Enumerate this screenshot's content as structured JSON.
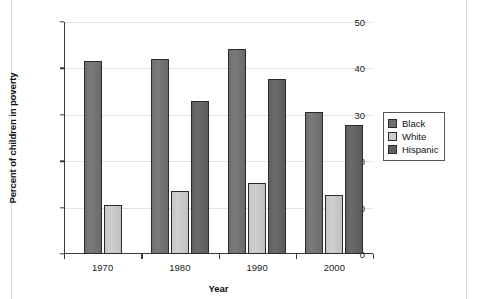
{
  "chart_data": {
    "type": "bar",
    "title": "",
    "xlabel": "Year",
    "ylabel": "Percent of children in poverty",
    "categories": [
      "1970",
      "1980",
      "1990",
      "2000"
    ],
    "series": [
      {
        "name": "Black",
        "color": "#6f6f6f",
        "values": [
          41.5,
          42.0,
          44.2,
          30.6
        ]
      },
      {
        "name": "White",
        "color": "#cbcbcb",
        "values": [
          10.5,
          13.5,
          15.2,
          12.8
        ]
      },
      {
        "name": "Hispanic",
        "color": "#5f5f5f",
        "values": [
          null,
          32.9,
          37.8,
          27.9
        ]
      }
    ],
    "ylim": [
      0,
      50
    ],
    "yticks": [
      0,
      10,
      20,
      30,
      40,
      50
    ],
    "ytick_labels": [
      "0",
      "10",
      "20",
      "30",
      "40",
      "50"
    ],
    "grid": "horizontal",
    "legend_position": "right",
    "legend_entries": [
      "Black",
      "White",
      "Hispanic"
    ]
  }
}
